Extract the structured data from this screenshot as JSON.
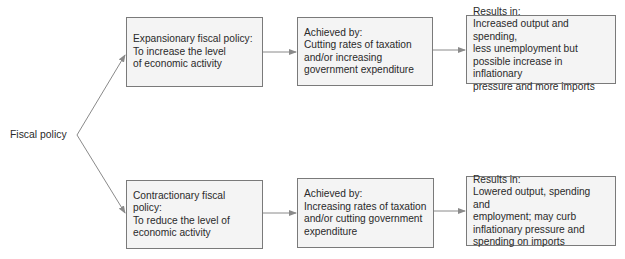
{
  "root": {
    "label": "Fiscal policy"
  },
  "branches": [
    {
      "policy": {
        "title": "Expansionary fiscal policy:",
        "lines": [
          "To increase the level",
          "of economic activity"
        ]
      },
      "method": {
        "title": "Achieved by:",
        "lines": [
          "Cutting rates of taxation",
          "and/or increasing",
          "government expenditure"
        ]
      },
      "result": {
        "title": "Results in:",
        "lines": [
          "Increased output and spending,",
          "less unemployment but",
          "possible increase in inflationary",
          "pressure and more imports"
        ]
      }
    },
    {
      "policy": {
        "title": "Contractionary fiscal policy:",
        "lines": [
          "To reduce the level of",
          "economic activity"
        ]
      },
      "method": {
        "title": "Achieved by:",
        "lines": [
          "Increasing rates of taxation",
          "and/or cutting government",
          "expenditure"
        ]
      },
      "result": {
        "title": "Results in:",
        "lines": [
          "Lowered output, spending and",
          "employment; may curb",
          "inflationary pressure and",
          "spending on imports"
        ]
      }
    }
  ],
  "colors": {
    "box_fill": "#f4f4f4",
    "box_border": "#7a7a7a",
    "arrow": "#8a8a8a",
    "text": "#2a2a2a"
  }
}
